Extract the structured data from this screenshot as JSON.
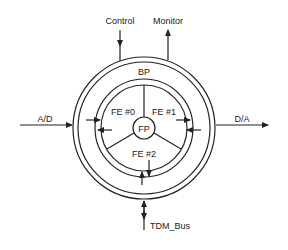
{
  "diagram": {
    "labels": {
      "control": "Control",
      "monitor": "Monitor",
      "bp": "BP",
      "ad": "A/D",
      "da": "D/A",
      "fe0": "FE #0",
      "fe1": "FE #1",
      "fe2": "FE #2",
      "fp": "FP",
      "tdm": "TDM_Bus"
    },
    "colors": {
      "stroke": "#222222",
      "background": "#ffffff"
    }
  }
}
